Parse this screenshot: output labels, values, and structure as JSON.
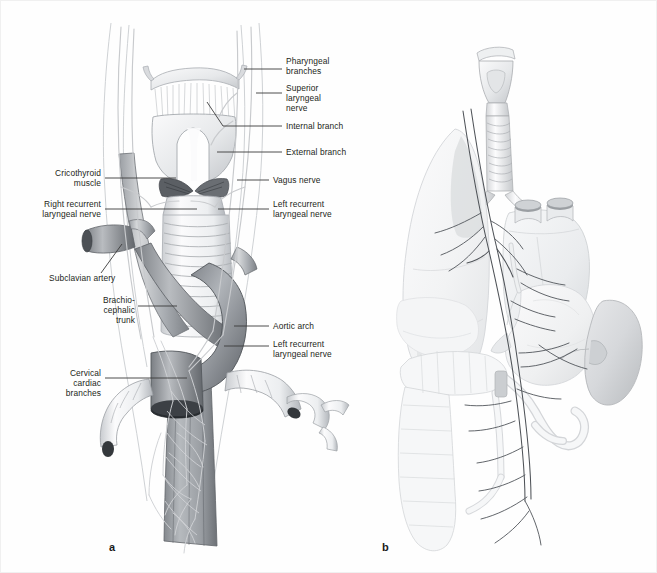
{
  "figure": {
    "domain": "anatomical-illustration",
    "background_color": "#fefefe",
    "border_color": "#f0f0f0",
    "label_color": "#231f20",
    "leader_color": "#3a3a3a",
    "ink_color": "#6f7377",
    "shade_light": "#e9eaec",
    "shade_mid": "#c3c6ca",
    "shade_dark": "#8d9196"
  },
  "panels": [
    {
      "letter": "a",
      "name": "panel-a",
      "caption": "Cervical and thoracic course of the vagus nerve",
      "letter_x": 108,
      "letter_y": 546
    },
    {
      "letter": "b",
      "name": "panel-b",
      "caption": "Overview of vagus nerve distribution to thoracic and abdominal viscera",
      "letter_x": 381,
      "letter_y": 546
    }
  ],
  "labels_left_panel": [
    {
      "id": "pharyngeal-branches",
      "text": "Pharyngeal\nbranches",
      "x": 285,
      "y": 60,
      "align": "left",
      "leader": {
        "x1": 243,
        "y1": 68,
        "x2": 281,
        "y2": 68
      }
    },
    {
      "id": "superior-laryngeal-nerve",
      "text": "Superior\nlaryngeal\nnerve",
      "x": 285,
      "y": 85,
      "align": "left",
      "leader": {
        "x1": 255,
        "y1": 92,
        "x2": 281,
        "y2": 92
      }
    },
    {
      "id": "internal-branch",
      "text": "Internal branch",
      "x": 285,
      "y": 120,
      "align": "left",
      "leader": {
        "x1": 222,
        "y1": 125,
        "x2": 281,
        "y2": 125
      }
    },
    {
      "id": "external-branch",
      "text": "External branch",
      "x": 285,
      "y": 146,
      "align": "left",
      "leader": {
        "x1": 216,
        "y1": 151,
        "x2": 281,
        "y2": 151
      }
    },
    {
      "id": "vagus-nerve",
      "text": "Vagus nerve",
      "x": 272,
      "y": 174,
      "align": "left",
      "leader": {
        "x1": 236,
        "y1": 179,
        "x2": 268,
        "y2": 179
      }
    },
    {
      "id": "cricothyroid-muscle",
      "text": "Cricothyroid\nmuscle",
      "x": 44,
      "y": 170,
      "align": "right",
      "leader": {
        "x1": 104,
        "y1": 177,
        "x2": 175,
        "y2": 177
      }
    },
    {
      "id": "right-recurrent-laryngeal",
      "text": "Right recurrent\nlaryngeal nerve",
      "x": 20,
      "y": 201,
      "align": "right",
      "leader": {
        "x1": 104,
        "y1": 208,
        "x2": 196,
        "y2": 208
      }
    },
    {
      "id": "left-recurrent-laryngeal-1",
      "text": "Left recurrent\nlaryngeal nerve",
      "x": 272,
      "y": 201,
      "align": "left",
      "leader": {
        "x1": 217,
        "y1": 208,
        "x2": 268,
        "y2": 208
      }
    },
    {
      "id": "subclavian-artery",
      "text": "Subclavian artery",
      "x": 48,
      "y": 275,
      "align": "left",
      "leader": {
        "x1": 100,
        "y1": 272,
        "x2": 121,
        "y2": 243
      }
    },
    {
      "id": "brachiocephalic-trunk",
      "text": "Brachio-\ncephalic\ntrunk",
      "x": 60,
      "y": 297,
      "align": "right",
      "leader": {
        "x1": 137,
        "y1": 305,
        "x2": 176,
        "y2": 305
      }
    },
    {
      "id": "aortic-arch",
      "text": "Aortic arch",
      "x": 272,
      "y": 320,
      "align": "left",
      "leader": {
        "x1": 233,
        "y1": 325,
        "x2": 268,
        "y2": 325
      }
    },
    {
      "id": "left-recurrent-laryngeal-2",
      "text": "Left recurrent\nlaryngeal nerve",
      "x": 272,
      "y": 340,
      "align": "left",
      "leader": {
        "x1": 223,
        "y1": 345,
        "x2": 268,
        "y2": 345
      }
    },
    {
      "id": "cervical-cardiac-branches",
      "text": "Cervical\ncardiac\nbranches",
      "x": 44,
      "y": 370,
      "align": "right",
      "leader": {
        "x1": 104,
        "y1": 377,
        "x2": 186,
        "y2": 377
      }
    }
  ],
  "structures_panel_a": [
    "hyoid bone",
    "thyrohyoid membrane",
    "thyroid cartilage",
    "cricothyroid muscle",
    "cricoid cartilage",
    "trachea with cartilage rings",
    "common carotid artery",
    "subclavian artery",
    "brachiocephalic trunk",
    "aortic arch",
    "vagus nerve trunk",
    "recurrent laryngeal nerves",
    "cardiac plexus branches",
    "esophagus"
  ],
  "structures_panel_b": [
    "larynx",
    "trachea",
    "right lung",
    "heart",
    "great vessels",
    "esophagus",
    "stomach",
    "liver",
    "duodenum",
    "small intestine",
    "transverse colon",
    "descending colon",
    "left kidney",
    "vagal trunks"
  ]
}
